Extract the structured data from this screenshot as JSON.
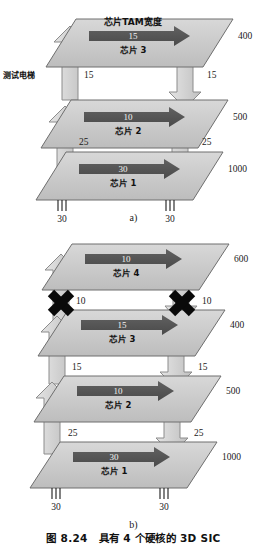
{
  "figure": {
    "caption_number": "图 8.24",
    "caption_text": "具有 4 个硬核的 3D SIC",
    "subcaption_a": "a)",
    "subcaption_b": "b)"
  },
  "annotations": {
    "tam_width_label": "芯片TAM宽度",
    "test_elevator_label": "测试电梯"
  },
  "diagram_a": {
    "layers": [
      {
        "chip_label": "芯片 3",
        "tam_width": "15",
        "right_value": "400"
      },
      {
        "chip_label": "芯片 2",
        "tam_width": "10",
        "right_value": "500"
      },
      {
        "chip_label": "芯片 1",
        "tam_width": "30",
        "right_value": "1000"
      }
    ],
    "elevator_left": [
      "15",
      "25"
    ],
    "elevator_right": [
      "15",
      "25"
    ],
    "pins_left": "30",
    "pins_right": "30",
    "pin_count": 3
  },
  "diagram_b": {
    "layers": [
      {
        "chip_label": "芯片 4",
        "tam_width": "10",
        "right_value": "600"
      },
      {
        "chip_label": "芯片 3",
        "tam_width": "15",
        "right_value": "400"
      },
      {
        "chip_label": "芯片 2",
        "tam_width": "10",
        "right_value": "500"
      },
      {
        "chip_label": "芯片 1",
        "tam_width": "30",
        "right_value": "1000"
      }
    ],
    "elevator_left": [
      "10",
      "15",
      "25"
    ],
    "elevator_right": [
      "10",
      "15",
      "25"
    ],
    "blocked_marks": [
      "cross-left",
      "cross-right"
    ],
    "pins_left": "30",
    "pins_right": "30",
    "pin_count": 3
  },
  "colors": {
    "layer_fill": "#c9c9c9",
    "layer_stroke": "#6e6e6e",
    "tam_arrow_fill": "#555555",
    "elevator_fill": "#d6d6d6",
    "elevator_stroke": "#8a8a8a",
    "cross_fill": "#0a0a0a",
    "text": "#1a1a1a"
  }
}
